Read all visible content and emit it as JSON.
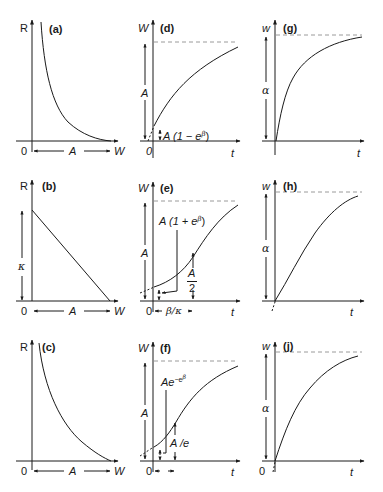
{
  "figure": {
    "colors": {
      "line": "#1a1a1a",
      "dash": "#9a9a9a",
      "background": "#ffffff"
    }
  },
  "panels": {
    "a": {
      "tag": "(a)",
      "ylabel": "R",
      "xlabel": "W",
      "origin": "0",
      "span": "A",
      "curve": "hyperbolic-decay"
    },
    "b": {
      "tag": "(b)",
      "ylabel": "R",
      "xlabel": "W",
      "origin": "0",
      "span": "A",
      "intercept": "κ",
      "curve": "linear-decline"
    },
    "c": {
      "tag": "(c)",
      "ylabel": "R",
      "xlabel": "W",
      "origin": "0",
      "span": "A",
      "curve": "exponential-decay"
    },
    "d": {
      "tag": "(d)",
      "ylabel": "W",
      "xlabel": "t",
      "origin": "0",
      "asymptote": "A",
      "initial_pre": "A (1 − e",
      "initial_sup": "β",
      "initial_post": ")",
      "curve": "monomolecular"
    },
    "e": {
      "tag": "(e)",
      "ylabel": "W",
      "xlabel": "t",
      "origin": "0",
      "asymptote": "A",
      "initial_pre": "A (1 + e",
      "initial_sup": "β",
      "initial_post": ")",
      "half_num": "A",
      "half_den": "2",
      "inflection_time": "β/κ",
      "curve": "logistic"
    },
    "f": {
      "tag": "(f)",
      "ylabel": "W",
      "xlabel": "t",
      "origin": "0",
      "asymptote": "A",
      "initial_pre": "Ae",
      "initial_sup": "−e",
      "initial_sup2": "β",
      "inflection_value": "A /e",
      "curve": "gompertz"
    },
    "g": {
      "tag": "(g)",
      "ylabel": "w",
      "xlabel": "t",
      "asymptote": "α",
      "curve": "fast-saturating"
    },
    "h": {
      "tag": "(h)",
      "ylabel": "w",
      "xlabel": "t",
      "asymptote": "α",
      "curve": "sigmoid-saturating"
    },
    "j": {
      "tag": "(j)",
      "ylabel": "w",
      "xlabel": "t",
      "origin": "0",
      "asymptote": "α",
      "curve": "saturating"
    }
  }
}
